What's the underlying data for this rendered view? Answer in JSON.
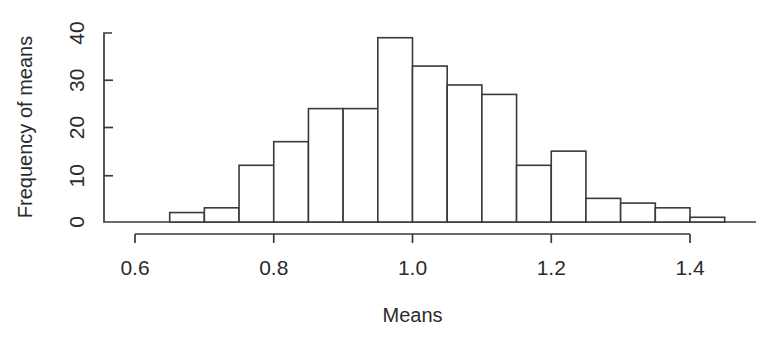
{
  "chart_data": {
    "type": "bar",
    "subtype": "histogram",
    "title": "",
    "xlabel": "Means",
    "ylabel": "Frequency of means",
    "bin_width": 0.05,
    "bin_edges": [
      0.65,
      0.7,
      0.75,
      0.8,
      0.85,
      0.9,
      0.95,
      1.0,
      1.05,
      1.1,
      1.15,
      1.2,
      1.25,
      1.3,
      1.35,
      1.4,
      1.45
    ],
    "categories": [
      "0.65-0.70",
      "0.70-0.75",
      "0.75-0.80",
      "0.80-0.85",
      "0.85-0.90",
      "0.90-0.95",
      "0.95-1.00",
      "1.00-1.05",
      "1.05-1.10",
      "1.10-1.15",
      "1.15-1.20",
      "1.20-1.25",
      "1.25-1.30",
      "1.30-1.35",
      "1.35-1.40",
      "1.40-1.45"
    ],
    "values": [
      2,
      3,
      12,
      17,
      24,
      24,
      39,
      33,
      29,
      27,
      12,
      15,
      5,
      4,
      3,
      1
    ],
    "xlim": [
      0.6,
      1.47
    ],
    "ylim": [
      0,
      40
    ],
    "xticks": [
      "0.6",
      "0.8",
      "1.0",
      "1.2",
      "1.4"
    ],
    "xtick_values": [
      0.6,
      0.8,
      1.0,
      1.2,
      1.4
    ],
    "yticks": [
      "0",
      "10",
      "20",
      "30",
      "40"
    ],
    "ytick_values": [
      0,
      10,
      20,
      30,
      40
    ],
    "grid": false,
    "legend": null,
    "bar_fill_color": "#ffffff",
    "bar_stroke_color": "#3a3a3a",
    "axis_color": "#3a3a3a",
    "background_color": "#ffffff"
  },
  "axes": {
    "y_title": "Frequency of means",
    "x_title": "Means"
  }
}
